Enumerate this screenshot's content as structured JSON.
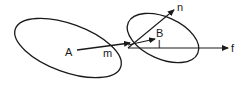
{
  "diagram": {
    "stroke_color": "#1a1a1a",
    "background": "#ffffff",
    "labels": {
      "A": "A",
      "m": "m",
      "B": "B",
      "l": "l",
      "n": "n",
      "f": "f"
    },
    "shapes": [
      {
        "name": "ellipse-A",
        "label": "A"
      },
      {
        "name": "ellipse-B",
        "label": "B"
      }
    ],
    "vectors": [
      {
        "name": "vector-m",
        "from": "A",
        "label": "m"
      },
      {
        "name": "vector-l",
        "label": "l"
      },
      {
        "name": "vector-n",
        "label": "n"
      },
      {
        "name": "vector-f",
        "label": "f"
      }
    ]
  }
}
